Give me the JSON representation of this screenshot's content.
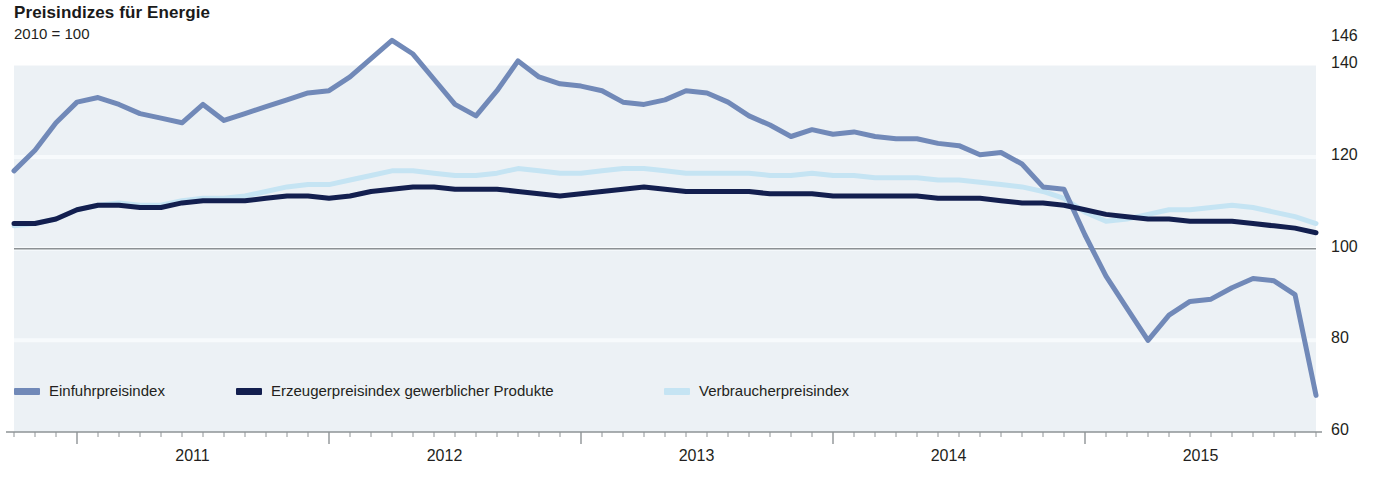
{
  "header": {
    "title": "Preisindizes für Energie",
    "subtitle": "2010 = 100"
  },
  "colors": {
    "import_index": "#7189b8",
    "producer_index": "#131f4f",
    "consumer_index": "#c5e4f3",
    "plot_band": "#e9eef3",
    "axis": "#8e9396",
    "gridline": "#f7fafc",
    "text": "#231f20"
  },
  "legend": {
    "position": "bottom-left",
    "items": [
      {
        "label": "Einfuhrpreisindex",
        "color": "#7189b8"
      },
      {
        "label": "Erzeugerpreisindex gewerblicher Produkte",
        "color": "#131f4f"
      },
      {
        "label": "Verbraucherpreisindex",
        "color": "#c5e4f3"
      }
    ]
  },
  "chart_data": {
    "type": "line",
    "title": "Preisindizes für Energie",
    "subtitle": "2010 = 100",
    "xlabel": "",
    "ylabel": "",
    "ylim": [
      60,
      148
    ],
    "yticks": [
      60,
      80,
      100,
      120,
      140,
      146
    ],
    "ytick_labels": [
      "60",
      "80",
      "100",
      "120",
      "140",
      "146"
    ],
    "xticks": [
      2011,
      2012,
      2013,
      2014,
      2015
    ],
    "xtick_labels": [
      "2011",
      "2012",
      "2013",
      "2014",
      "2015"
    ],
    "x_start": "2010-10",
    "x_end": "2015-12",
    "x_tick_interval": "monthly",
    "grid": true,
    "reference_line": 100,
    "x": [
      "2010-10",
      "2010-11",
      "2010-12",
      "2011-01",
      "2011-02",
      "2011-03",
      "2011-04",
      "2011-05",
      "2011-06",
      "2011-07",
      "2011-08",
      "2011-09",
      "2011-10",
      "2011-11",
      "2011-12",
      "2012-01",
      "2012-02",
      "2012-03",
      "2012-04",
      "2012-05",
      "2012-06",
      "2012-07",
      "2012-08",
      "2012-09",
      "2012-10",
      "2012-11",
      "2012-12",
      "2013-01",
      "2013-02",
      "2013-03",
      "2013-04",
      "2013-05",
      "2013-06",
      "2013-07",
      "2013-08",
      "2013-09",
      "2013-10",
      "2013-11",
      "2013-12",
      "2014-01",
      "2014-02",
      "2014-03",
      "2014-04",
      "2014-05",
      "2014-06",
      "2014-07",
      "2014-08",
      "2014-09",
      "2014-10",
      "2014-11",
      "2014-12",
      "2015-01",
      "2015-02",
      "2015-03",
      "2015-04",
      "2015-05",
      "2015-06",
      "2015-07",
      "2015-08",
      "2015-09",
      "2015-10",
      "2015-11",
      "2015-12"
    ],
    "series": [
      {
        "name": "Einfuhrpreisindex",
        "color": "#7189b8",
        "values": [
          117.0,
          121.5,
          127.5,
          132.0,
          133.0,
          131.5,
          129.5,
          128.5,
          127.5,
          131.5,
          128.0,
          129.5,
          131.0,
          132.5,
          134.0,
          134.5,
          137.5,
          141.5,
          145.5,
          142.5,
          137.0,
          131.5,
          129.0,
          134.5,
          141.0,
          137.5,
          136.0,
          135.5,
          134.5,
          132.0,
          131.5,
          132.5,
          134.5,
          134.0,
          132.0,
          129.0,
          127.0,
          124.5,
          126.0,
          125.0,
          125.5,
          124.5,
          124.0,
          124.0,
          123.0,
          122.5,
          120.5,
          121.0,
          118.5,
          113.5,
          113.0,
          103.0,
          94.0,
          87.0,
          80.0,
          85.5,
          88.5,
          89.0,
          91.5,
          93.5,
          93.0,
          90.0,
          68.0
        ]
      },
      {
        "name": "Erzeugerpreisindex gewerblicher Produkte",
        "color": "#131f4f",
        "values": [
          105.5,
          105.5,
          106.5,
          108.5,
          109.5,
          109.5,
          109.0,
          109.0,
          110.0,
          110.5,
          110.5,
          110.5,
          111.0,
          111.5,
          111.5,
          111.0,
          111.5,
          112.5,
          113.0,
          113.5,
          113.5,
          113.0,
          113.0,
          113.0,
          112.5,
          112.0,
          111.5,
          112.0,
          112.5,
          113.0,
          113.5,
          113.0,
          112.5,
          112.5,
          112.5,
          112.5,
          112.0,
          112.0,
          112.0,
          111.5,
          111.5,
          111.5,
          111.5,
          111.5,
          111.0,
          111.0,
          111.0,
          110.5,
          110.0,
          110.0,
          109.5,
          108.5,
          107.5,
          107.0,
          106.5,
          106.5,
          106.0,
          106.0,
          106.0,
          105.5,
          105.0,
          104.5,
          103.5
        ]
      },
      {
        "name": "Verbraucherpreisindex",
        "color": "#c5e4f3",
        "values": [
          105.0,
          105.5,
          106.5,
          108.5,
          109.5,
          110.0,
          109.5,
          109.5,
          110.5,
          111.0,
          111.0,
          111.5,
          112.5,
          113.5,
          114.0,
          114.0,
          115.0,
          116.0,
          117.0,
          117.0,
          116.5,
          116.0,
          116.0,
          116.5,
          117.5,
          117.0,
          116.5,
          116.5,
          117.0,
          117.5,
          117.5,
          117.0,
          116.5,
          116.5,
          116.5,
          116.5,
          116.0,
          116.0,
          116.5,
          116.0,
          116.0,
          115.5,
          115.5,
          115.5,
          115.0,
          115.0,
          114.5,
          114.0,
          113.5,
          112.5,
          111.0,
          108.0,
          106.0,
          106.5,
          107.5,
          108.5,
          108.5,
          109.0,
          109.5,
          109.0,
          108.0,
          107.0,
          105.5
        ]
      }
    ]
  }
}
